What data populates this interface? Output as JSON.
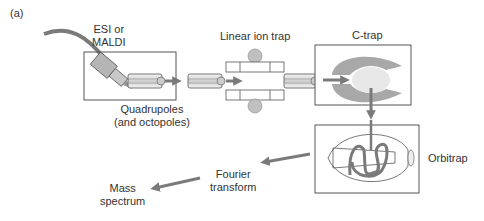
{
  "figure": {
    "panel_label": "(a)"
  },
  "labels": {
    "source": [
      "ESI or",
      "MALDI"
    ],
    "quadrupoles": [
      "Quadrupoles",
      "(and octopoles)"
    ],
    "linear_ion_trap": "Linear ion trap",
    "c_trap": "C-trap",
    "orbitrap": "Orbitrap",
    "fourier": [
      "Fourier",
      "transform"
    ],
    "mass_spectrum": [
      "Mass",
      "spectrum"
    ]
  },
  "colors": {
    "arrow": "#7a7a7a",
    "component_fill": "#b5b5b5",
    "light_fill": "#e8e8e8",
    "outline": "#555555"
  },
  "flow": [
    "ESI or MALDI",
    "Quadrupoles (and octopoles)",
    "Linear ion trap",
    "C-trap",
    "Orbitrap",
    "Fourier transform",
    "Mass spectrum"
  ]
}
